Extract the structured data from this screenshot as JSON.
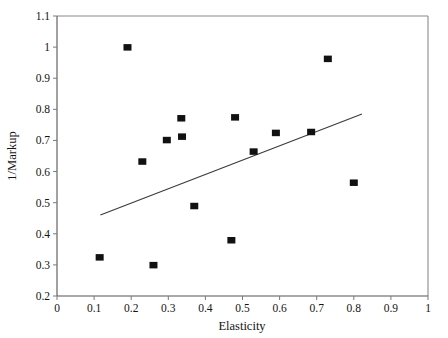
{
  "chart_data": {
    "type": "scatter",
    "title": "",
    "xlabel": "Elasticity",
    "ylabel": "1/Markup",
    "xlim": [
      0,
      1
    ],
    "ylim": [
      0.2,
      1.1
    ],
    "grid": false,
    "legend": null,
    "xticks": [
      "0",
      "0.1",
      "0.2",
      "0.3",
      "0.4",
      "0.5",
      "0.6",
      "0.7",
      "0.8",
      "0.9",
      "1"
    ],
    "xtick_values": [
      0,
      0.1,
      0.2,
      0.3,
      0.4,
      0.5,
      0.6,
      0.7,
      0.8,
      0.9,
      1
    ],
    "yticks": [
      "0.2",
      "0.3",
      "0.4",
      "0.5",
      "0.6",
      "0.7",
      "0.8",
      "0.9",
      "1",
      "1.1"
    ],
    "ytick_values": [
      0.2,
      0.3,
      0.4,
      0.5,
      0.6,
      0.7,
      0.8,
      0.9,
      1.0,
      1.1
    ],
    "marker": {
      "shape": "square",
      "color": "#111111",
      "size": 8
    },
    "points": [
      {
        "x": 0.115,
        "y": 0.325
      },
      {
        "x": 0.19,
        "y": 1.0
      },
      {
        "x": 0.23,
        "y": 0.633
      },
      {
        "x": 0.26,
        "y": 0.3
      },
      {
        "x": 0.296,
        "y": 0.702
      },
      {
        "x": 0.335,
        "y": 0.772
      },
      {
        "x": 0.337,
        "y": 0.713
      },
      {
        "x": 0.37,
        "y": 0.49
      },
      {
        "x": 0.47,
        "y": 0.38
      },
      {
        "x": 0.48,
        "y": 0.775
      },
      {
        "x": 0.53,
        "y": 0.665
      },
      {
        "x": 0.59,
        "y": 0.725
      },
      {
        "x": 0.685,
        "y": 0.728
      },
      {
        "x": 0.73,
        "y": 0.963
      },
      {
        "x": 0.8,
        "y": 0.565
      }
    ],
    "trend_line": {
      "x0": 0.117,
      "y0": 0.46,
      "x1": 0.822,
      "y1": 0.785,
      "color": "#3a3a3a"
    }
  },
  "axes": {
    "x_title": "Elasticity",
    "y_title": "1/Markup"
  }
}
